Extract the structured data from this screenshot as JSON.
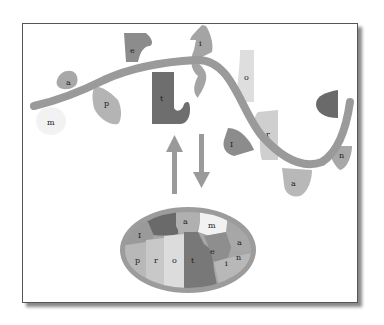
{
  "diagram": {
    "chain_letters": [
      {
        "char": "m",
        "tone": "#f2f2f2"
      },
      {
        "char": "a",
        "tone": "#a8a8a8"
      },
      {
        "char": "p",
        "tone": "#b4b4b4"
      },
      {
        "char": "e",
        "tone": "#8c8c8c"
      },
      {
        "char": "t",
        "tone": "#6e6e6e"
      },
      {
        "char": "i",
        "tone": "#a4a4a4"
      },
      {
        "char": "o",
        "tone": "#dedede"
      },
      {
        "char": "I",
        "tone": "#8c8c8c"
      },
      {
        "char": "r",
        "tone": "#cfcfcf"
      },
      {
        "char": "a",
        "tone": "#b8b8b8"
      },
      {
        "char": "n",
        "tone": "#a8a8a8"
      }
    ],
    "folded_protein_letters": [
      "I",
      "a",
      "m",
      "p",
      "r",
      "o",
      "t",
      "e",
      "i",
      "n",
      "a"
    ],
    "arrows": {
      "up": "fold",
      "down": "unfold"
    },
    "colors": {
      "chain": "#9a9a9a",
      "dark_piece": "#6a6a6a",
      "oval_border": "#9c9c9c",
      "arrow": "#9a9a9a",
      "frame_border": "#555555"
    }
  }
}
